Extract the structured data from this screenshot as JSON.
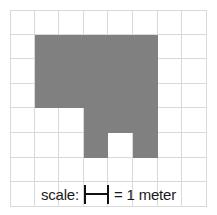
{
  "figure": {
    "background_color": "#ffffff"
  },
  "grid": {
    "columns": 8,
    "rows": 8,
    "cell_size_px": 24.6,
    "line_color": "#d9d9d9",
    "shade_color": "#808080",
    "shaded_cells": [
      [
        1,
        1
      ],
      [
        2,
        1
      ],
      [
        3,
        1
      ],
      [
        4,
        1
      ],
      [
        5,
        1
      ],
      [
        1,
        2
      ],
      [
        2,
        2
      ],
      [
        3,
        2
      ],
      [
        4,
        2
      ],
      [
        5,
        2
      ],
      [
        1,
        3
      ],
      [
        2,
        3
      ],
      [
        3,
        3
      ],
      [
        4,
        3
      ],
      [
        5,
        3
      ],
      [
        3,
        4
      ],
      [
        4,
        4
      ],
      [
        5,
        4
      ],
      [
        3,
        5
      ],
      [
        5,
        5
      ]
    ],
    "shaded_cell_count": 20
  },
  "scale_legend": {
    "label": "scale:",
    "bar_icon": "scale-bar-icon",
    "equals_text": "= 1 meter",
    "unit_value": "1",
    "unit_name": "meter"
  }
}
